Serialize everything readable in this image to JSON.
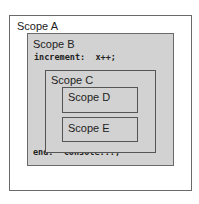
{
  "diagram": {
    "scopes": {
      "a": {
        "label": "Scope A"
      },
      "b": {
        "label": "Scope B",
        "statement": "increment:  x++;",
        "end_statement": "end:  Console...;"
      },
      "c": {
        "label": "Scope C"
      },
      "d": {
        "label": "Scope D"
      },
      "e": {
        "label": "Scope E"
      }
    },
    "colors": {
      "outer_fill": "#ffffff",
      "inner_fill": "#d2d2d2",
      "border": "#6a6a6a"
    }
  }
}
